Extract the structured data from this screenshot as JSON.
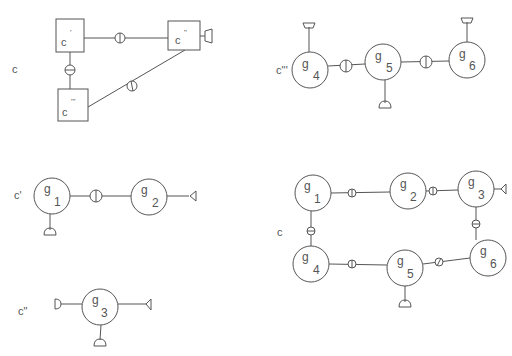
{
  "colors": {
    "stroke": "#555555",
    "background": "#ffffff"
  },
  "diagrams": {
    "composite_c_top": {
      "label": "c",
      "boxes": [
        {
          "id": "c1",
          "label": "c",
          "prime": "'"
        },
        {
          "id": "c2",
          "label": "c",
          "prime": "\""
        },
        {
          "id": "c3",
          "label": "c",
          "prime": "'''"
        }
      ],
      "links": [
        {
          "from": "c'",
          "to": "c\"",
          "symbol": "vertical-bar-circle"
        },
        {
          "from": "c'",
          "to": "c'''",
          "symbol": "horizontal-bar-circle"
        },
        {
          "from": "c\"",
          "to": "c'''",
          "symbol": "slash-circle"
        }
      ],
      "ports": [
        {
          "on": "c\"",
          "side": "right"
        }
      ]
    },
    "component_c3": {
      "label": "c'''",
      "nodes": [
        {
          "id": "g4",
          "base": "g",
          "sub": "4"
        },
        {
          "id": "g5",
          "base": "g",
          "sub": "5"
        },
        {
          "id": "g6",
          "base": "g",
          "sub": "6"
        }
      ],
      "links": [
        {
          "from": "g4",
          "to": "g5"
        },
        {
          "from": "g5",
          "to": "g6"
        }
      ],
      "ports": [
        {
          "on": "g4",
          "side": "top"
        },
        {
          "on": "g5",
          "side": "bottom"
        },
        {
          "on": "g6",
          "side": "top"
        }
      ]
    },
    "component_c1": {
      "label": "c'",
      "nodes": [
        {
          "id": "g1",
          "base": "g",
          "sub": "1"
        },
        {
          "id": "g2",
          "base": "g",
          "sub": "2"
        }
      ],
      "links": [
        {
          "from": "g1",
          "to": "g2"
        }
      ],
      "ports": [
        {
          "on": "g1",
          "side": "bottom"
        },
        {
          "on": "g2",
          "side": "right"
        }
      ]
    },
    "component_c2": {
      "label": "c\"",
      "nodes": [
        {
          "id": "g3",
          "base": "g",
          "sub": "3"
        }
      ],
      "ports": [
        {
          "on": "g3",
          "side": "left"
        },
        {
          "on": "g3",
          "side": "right"
        },
        {
          "on": "g3",
          "side": "bottom"
        }
      ]
    },
    "flattened_c": {
      "label": "c",
      "nodes": [
        {
          "id": "g1",
          "base": "g",
          "sub": "1"
        },
        {
          "id": "g2",
          "base": "g",
          "sub": "2"
        },
        {
          "id": "g3",
          "base": "g",
          "sub": "3"
        },
        {
          "id": "g4",
          "base": "g",
          "sub": "4"
        },
        {
          "id": "g5",
          "base": "g",
          "sub": "5"
        },
        {
          "id": "g6",
          "base": "g",
          "sub": "6"
        }
      ],
      "links": [
        {
          "from": "g1",
          "to": "g2"
        },
        {
          "from": "g2",
          "to": "g3"
        },
        {
          "from": "g1",
          "to": "g4"
        },
        {
          "from": "g3",
          "to": "g6"
        },
        {
          "from": "g4",
          "to": "g5"
        },
        {
          "from": "g5",
          "to": "g6"
        }
      ],
      "ports": [
        {
          "on": "g3",
          "side": "right"
        },
        {
          "on": "g5",
          "side": "bottom"
        }
      ]
    }
  }
}
